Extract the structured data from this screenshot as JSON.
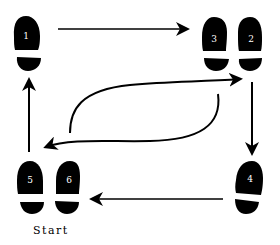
{
  "diagram": {
    "type": "dance-step-footprints",
    "start_label": "Start",
    "steps": [
      {
        "number": "1",
        "foot": "left"
      },
      {
        "number": "2",
        "foot": "right"
      },
      {
        "number": "3",
        "foot": "left"
      },
      {
        "number": "4",
        "foot": "right"
      },
      {
        "number": "5",
        "foot": "left"
      },
      {
        "number": "6",
        "foot": "right"
      }
    ],
    "arrows": [
      {
        "from": "1",
        "to": "3/2",
        "direction": "right"
      },
      {
        "from": "2",
        "to": "4",
        "direction": "down"
      },
      {
        "from": "4",
        "to": "6",
        "direction": "left"
      },
      {
        "from": "5",
        "to": "1",
        "direction": "up"
      },
      {
        "from": "5/6",
        "to": "3/2",
        "direction": "curved up-right"
      },
      {
        "from": "3/2",
        "to": "5",
        "direction": "curved down-left"
      }
    ],
    "colors": {
      "foot": "#000000",
      "number": "#ffffff",
      "arrow": "#000000"
    }
  }
}
